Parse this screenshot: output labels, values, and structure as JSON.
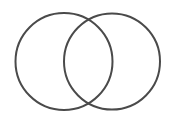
{
  "diagram": {
    "type": "venn",
    "stroke_color": "#4a4a4a",
    "background": "#ffffff",
    "circles": [
      {
        "name": "left-circle",
        "cx": 64,
        "cy": 61.5,
        "r": 48.5
      },
      {
        "name": "right-circle",
        "cx": 112,
        "cy": 61.5,
        "r": 48
      }
    ]
  }
}
